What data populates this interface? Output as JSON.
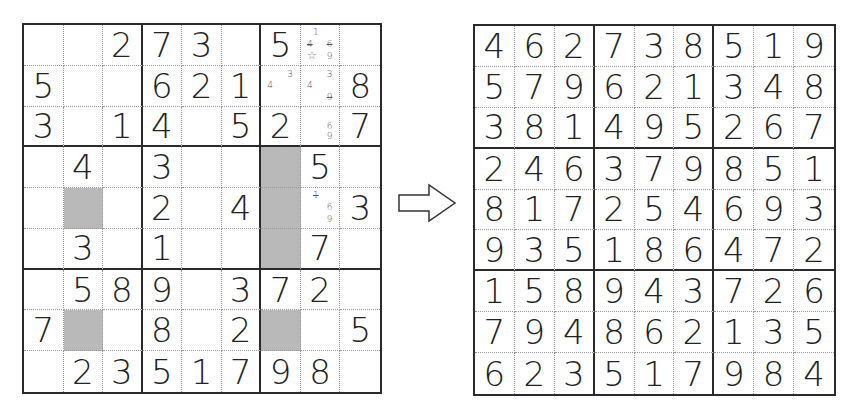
{
  "puzzle": {
    "title": "Sudoku puzzle (partially solved)",
    "rows": [
      [
        "",
        "",
        "2",
        "7",
        "3",
        "",
        "5",
        "",
        ""
      ],
      [
        "5",
        "",
        "",
        "6",
        "2",
        "1",
        "",
        "",
        "8"
      ],
      [
        "3",
        "",
        "1",
        "4",
        "",
        "5",
        "2",
        "",
        "7"
      ],
      [
        "",
        "4",
        "",
        "3",
        "",
        "",
        "",
        "5",
        ""
      ],
      [
        "",
        "",
        "",
        "2",
        "",
        "4",
        "",
        "",
        "3"
      ],
      [
        "",
        "3",
        "",
        "1",
        "",
        "",
        "",
        "7",
        ""
      ],
      [
        "",
        "5",
        "8",
        "9",
        "",
        "3",
        "7",
        "2",
        ""
      ],
      [
        "7",
        "",
        "",
        "8",
        "",
        "2",
        "",
        "",
        "5"
      ],
      [
        "",
        "2",
        "3",
        "5",
        "1",
        "7",
        "9",
        "8",
        ""
      ]
    ],
    "shaded_cells": [
      [
        5,
        2
      ],
      [
        8,
        2
      ],
      [
        4,
        7
      ],
      [
        5,
        7
      ],
      [
        6,
        7
      ],
      [
        8,
        7
      ]
    ],
    "pencil_marks": [
      {
        "row": 1,
        "col": 8,
        "marks": [
          {
            "v": "1",
            "pos": "top-left"
          },
          {
            "v": "4",
            "pos": "mid-left",
            "struck": true
          },
          {
            "v": "6",
            "pos": "mid-right",
            "struck": true
          },
          {
            "v": "9",
            "pos": "bottom-right"
          },
          {
            "v": "☆",
            "pos": "bottom-left"
          }
        ]
      },
      {
        "row": 2,
        "col": 7,
        "marks": [
          {
            "v": "3",
            "pos": "top-right"
          },
          {
            "v": "4",
            "pos": "mid-left"
          }
        ]
      },
      {
        "row": 2,
        "col": 8,
        "marks": [
          {
            "v": "3",
            "pos": "top-right"
          },
          {
            "v": "4",
            "pos": "mid-left"
          },
          {
            "v": "9",
            "pos": "bottom-right",
            "struck": true
          }
        ]
      },
      {
        "row": 3,
        "col": 8,
        "marks": [
          {
            "v": "6",
            "pos": "mid-right"
          },
          {
            "v": "9",
            "pos": "bottom-right"
          }
        ]
      },
      {
        "row": 5,
        "col": 8,
        "marks": [
          {
            "v": "1",
            "pos": "top-left",
            "struck": true
          },
          {
            "v": "6",
            "pos": "mid-right"
          },
          {
            "v": "9",
            "pos": "bottom-right"
          }
        ]
      }
    ]
  },
  "arrow": {
    "icon": "right-arrow-icon"
  },
  "solution": {
    "title": "Solved Sudoku",
    "rows": [
      [
        "4",
        "6",
        "2",
        "7",
        "3",
        "8",
        "5",
        "1",
        "9"
      ],
      [
        "5",
        "7",
        "9",
        "6",
        "2",
        "1",
        "3",
        "4",
        "8"
      ],
      [
        "3",
        "8",
        "1",
        "4",
        "9",
        "5",
        "2",
        "6",
        "7"
      ],
      [
        "2",
        "4",
        "6",
        "3",
        "7",
        "9",
        "8",
        "5",
        "1"
      ],
      [
        "8",
        "1",
        "7",
        "2",
        "5",
        "4",
        "6",
        "9",
        "3"
      ],
      [
        "9",
        "3",
        "5",
        "1",
        "8",
        "6",
        "4",
        "7",
        "2"
      ],
      [
        "1",
        "5",
        "8",
        "9",
        "4",
        "3",
        "7",
        "2",
        "6"
      ],
      [
        "7",
        "9",
        "4",
        "8",
        "6",
        "2",
        "1",
        "3",
        "5"
      ],
      [
        "6",
        "2",
        "3",
        "5",
        "1",
        "7",
        "9",
        "8",
        "4"
      ]
    ]
  },
  "colors": {
    "grid_line": "#2a2a2a",
    "shade": "#b9b9b9",
    "digit": "#222222",
    "pencil": "#555555"
  }
}
